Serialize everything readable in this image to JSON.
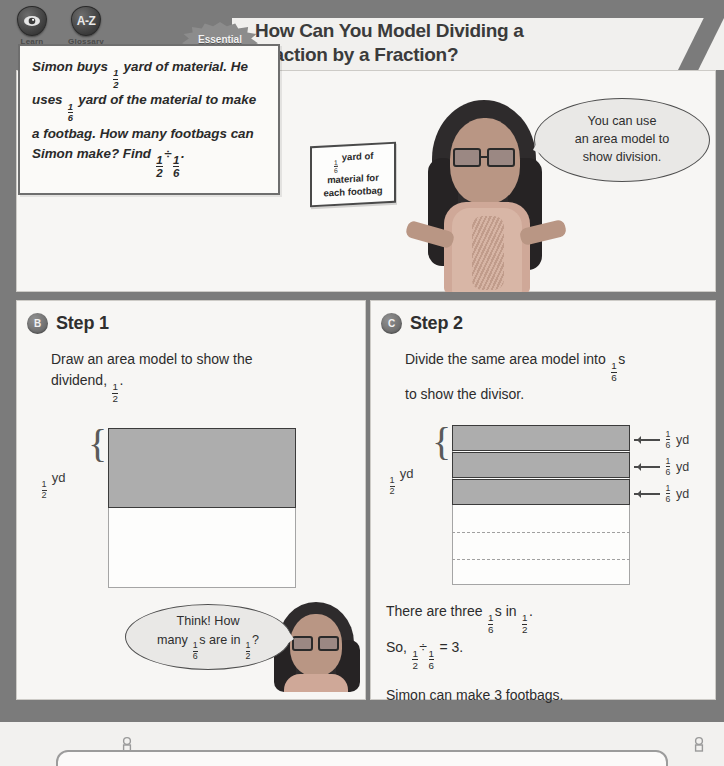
{
  "toolbar": {
    "items": [
      {
        "icon": "eye-icon",
        "label": "Learn"
      },
      {
        "icon": "a-z-icon",
        "label": "Glossary",
        "glyph": "A-Z"
      }
    ]
  },
  "header": {
    "badge_line1": "Essential",
    "badge_line2": "Question",
    "title_line1": "How Can You Model Dividing a",
    "title_line2": "Fraction by a Fraction?"
  },
  "panel_a": {
    "letter": "A",
    "problem": {
      "line1_pre": "Simon buys ",
      "frac1": {
        "n": "1",
        "d": "2"
      },
      "line1_post": " yard of material.",
      "line2_pre": "He uses ",
      "frac2": {
        "n": "1",
        "d": "6"
      },
      "line2_post": " yard of the material",
      "line3": "to make a footbag. How many",
      "line4": "footbags can Simon make? Find",
      "frac3": {
        "n": "1",
        "d": "2"
      },
      "divide": "÷",
      "frac4": {
        "n": "1",
        "d": "6"
      },
      "period": "."
    },
    "callout": {
      "frac": {
        "n": "1",
        "d": "6"
      },
      "line1_post": " yard of",
      "line2": "material for",
      "line3": "each footbag"
    },
    "bubble": {
      "line1": "You can use",
      "line2": "an area model to",
      "line3": "show division."
    }
  },
  "step1": {
    "letter": "B",
    "title": "Step 1",
    "text_line1": "Draw an area model to show the",
    "text_line2_pre": "dividend, ",
    "text_frac": {
      "n": "1",
      "d": "2"
    },
    "text_line2_post": ".",
    "model": {
      "brace_label_frac": {
        "n": "1",
        "d": "2"
      },
      "brace_label_unit": "yd",
      "shaded_fraction": 0.5
    },
    "think_bubble": {
      "line1": "Think! How",
      "line2_pre": "many ",
      "frac1": {
        "n": "1",
        "d": "6"
      },
      "line2_mid": "s are in ",
      "frac2": {
        "n": "1",
        "d": "2"
      },
      "line2_post": "?"
    }
  },
  "step2": {
    "letter": "C",
    "title": "Step 2",
    "text_line1_pre": "Divide the same area model into ",
    "text_frac": {
      "n": "1",
      "d": "6"
    },
    "text_line1_post": "s",
    "text_line2": "to show the divisor.",
    "model": {
      "brace_label_frac": {
        "n": "1",
        "d": "2"
      },
      "brace_label_unit": "yd",
      "bands": [
        {
          "frac": {
            "n": "1",
            "d": "6"
          },
          "unit": "yd"
        },
        {
          "frac": {
            "n": "1",
            "d": "6"
          },
          "unit": "yd"
        },
        {
          "frac": {
            "n": "1",
            "d": "6"
          },
          "unit": "yd"
        }
      ],
      "dashed_divisions": 2
    },
    "conclusion": {
      "l1_pre": "There are three ",
      "l1_frac1": {
        "n": "1",
        "d": "6"
      },
      "l1_mid": "s in ",
      "l1_frac2": {
        "n": "1",
        "d": "2"
      },
      "l1_post": ".",
      "l2_pre": "So, ",
      "l2_frac1": {
        "n": "1",
        "d": "2"
      },
      "l2_div": "÷",
      "l2_frac2": {
        "n": "1",
        "d": "6"
      },
      "l2_post": " = 3.",
      "l3": "Simon can make 3 footbags."
    }
  },
  "colors": {
    "page_background": "#7b7b7b",
    "panel_background": "#f7f6f4",
    "shade_fill": "#adadad",
    "model_stroke": "#3b3b3b",
    "text": "#2c2c2c"
  }
}
